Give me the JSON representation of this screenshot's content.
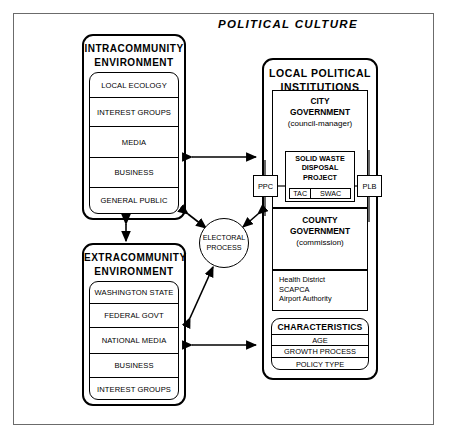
{
  "title": "POLITICAL  CULTURE",
  "intracommunity": {
    "title_line1": "INTRACOMMUNITY",
    "title_line2": "ENVIRONMENT",
    "items": [
      {
        "label": "LOCAL ECOLOGY"
      },
      {
        "label": "INTEREST GROUPS"
      },
      {
        "label": "MEDIA"
      },
      {
        "label": "BUSINESS"
      },
      {
        "label": "GENERAL PUBLIC"
      }
    ]
  },
  "extracommunity": {
    "title_line1": "EXTRACOMMUNITY",
    "title_line2": "ENVIRONMENT",
    "items": [
      {
        "label": "WASHINGTON STATE"
      },
      {
        "label": "FEDERAL GOVT"
      },
      {
        "label": "NATIONAL MEDIA"
      },
      {
        "label": "BUSINESS"
      },
      {
        "label": "INTEREST GROUPS"
      }
    ]
  },
  "electoral": {
    "line1": "ELECTORAL",
    "line2": "PROCESS"
  },
  "local_political": {
    "title_line1": "LOCAL  POLITICAL",
    "title_line2": "INSTITUTIONS",
    "city": {
      "head_line1": "CITY",
      "head_line2": "GOVERNMENT",
      "sub": "(council-manager)"
    },
    "county": {
      "head_line1": "COUNTY",
      "head_line2": "GOVERNMENT",
      "sub": "(commission)"
    },
    "agencies": [
      {
        "label": "Health  District"
      },
      {
        "label": "SCAPCA"
      },
      {
        "label": "Airport  Authority"
      }
    ],
    "solid_waste": {
      "line1": "SOLID WASTE",
      "line2": "DISPOSAL",
      "line3": "PROJECT",
      "sub_left": "TAC",
      "sub_right": "SWAC"
    },
    "tags": {
      "left": "PPC",
      "right": "PLB"
    },
    "characteristics": {
      "title": "CHARACTERISTICS",
      "rows": [
        {
          "label": "AGE"
        },
        {
          "label": "GROWTH PROCESS"
        },
        {
          "label": "POLICY TYPE"
        }
      ]
    }
  },
  "colors": {
    "frame": "#6b6b6b",
    "ink": "#000000",
    "paper": "#ffffff"
  }
}
